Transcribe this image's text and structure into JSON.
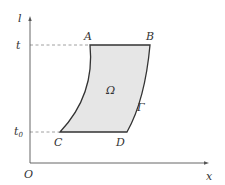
{
  "diagram": {
    "axes": {
      "vertical_label": "l",
      "horizontal_label": "x",
      "origin_label": "O"
    },
    "levels": {
      "top": "t",
      "bottom_base": "t",
      "bottom_sub": "0"
    },
    "points": {
      "A": "A",
      "B": "B",
      "C": "C",
      "D": "D"
    },
    "region_label": "Ω",
    "boundary_label": "Γ",
    "colors": {
      "region_fill": "#e6e6e6",
      "stroke": "#333333",
      "dashed": "#888888"
    }
  }
}
